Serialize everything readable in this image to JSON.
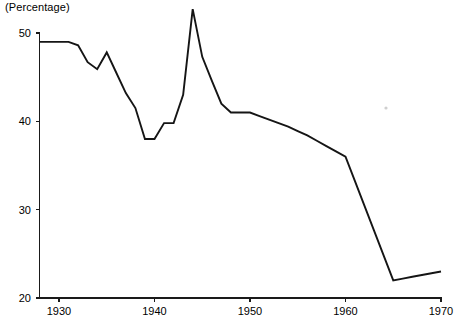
{
  "axis_unit_label": "(Percentage)",
  "colors": {
    "line": "#151515",
    "axis": "#1a1a1a",
    "background": "#ffffff",
    "text": "#000000"
  },
  "chart_data": {
    "type": "line",
    "title": "",
    "subtitle": "",
    "xlabel": "",
    "ylabel": "(Percentage)",
    "grid": false,
    "legend": "none",
    "xlim": [
      1928,
      1970
    ],
    "ylim": [
      20,
      50
    ],
    "xticks": [
      1930,
      1940,
      1950,
      1960,
      1970
    ],
    "xtick_labels": [
      "1930",
      "1940",
      "1950",
      "1960",
      "1970"
    ],
    "yticks": [
      20,
      30,
      40,
      50
    ],
    "ytick_labels": [
      "20",
      "30",
      "40",
      "50"
    ],
    "series": [
      {
        "name": "Percentage",
        "x": [
          1928,
          1929,
          1930,
          1931,
          1932,
          1933,
          1934,
          1935,
          1936,
          1937,
          1938,
          1939,
          1940,
          1941,
          1942,
          1943,
          1944,
          1945,
          1946,
          1947,
          1948,
          1949,
          1950,
          1951,
          1952,
          1953,
          1954,
          1955,
          1956,
          1957,
          1958,
          1959,
          1960,
          1961,
          1962,
          1963,
          1964,
          1965,
          1966,
          1967,
          1968,
          1969,
          1970
        ],
        "values": [
          49.0,
          49.0,
          49.0,
          49.0,
          48.6,
          46.7,
          45.9,
          47.8,
          45.5,
          43.2,
          41.5,
          38.0,
          38.0,
          39.8,
          39.8,
          43.0,
          52.7,
          47.3,
          44.6,
          42.0,
          41.0,
          41.0,
          41.0,
          40.6,
          40.2,
          39.8,
          39.4,
          38.9,
          38.4,
          37.8,
          37.2,
          36.6,
          36.0,
          33.2,
          30.4,
          27.6,
          24.8,
          22.0,
          22.2,
          22.4,
          22.6,
          22.8,
          23.0
        ]
      }
    ]
  }
}
